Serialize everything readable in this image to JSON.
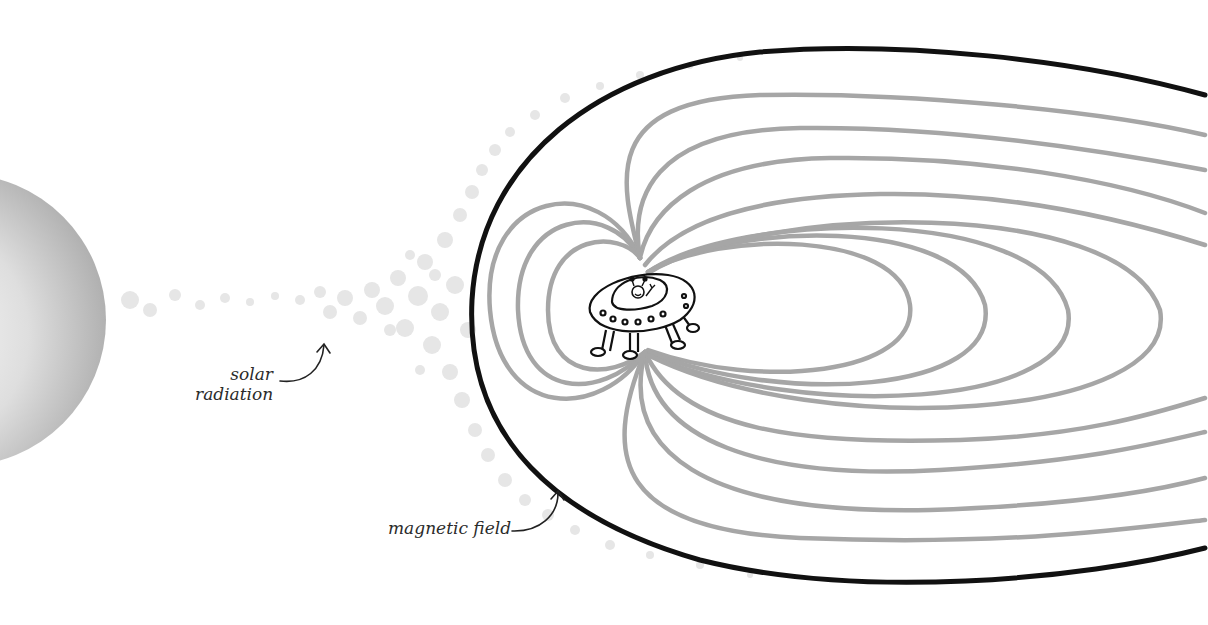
{
  "diagram": {
    "title": "",
    "labels": {
      "solar_line1": "solar",
      "solar_line2": "radiation",
      "magnetic": "magnetic field"
    },
    "elements": [
      {
        "id": "sun",
        "icon": "sun-sphere",
        "description": "gray shaded sphere at left edge"
      },
      {
        "id": "solar-wind",
        "icon": "particle-cloud",
        "description": "faint gray dotted particle stream"
      },
      {
        "id": "magnetosphere",
        "icon": "magnetosphere-boundary",
        "description": "thick black bow-shaped boundary"
      },
      {
        "id": "field-lines",
        "icon": "magnetic-field-lines",
        "description": "gray dipole field lines stretched into tail"
      },
      {
        "id": "ufo",
        "icon": "ufo-alien",
        "description": "cartoon flying saucer with waving alien at dipole center"
      }
    ],
    "colors": {
      "boundary": "#111111",
      "field_lines": "#a6a6a6",
      "particles": "#e3e3e3",
      "sun_light": "#fafafa",
      "sun_dark": "#b0b0b0",
      "text": "#2b2b2b"
    }
  }
}
